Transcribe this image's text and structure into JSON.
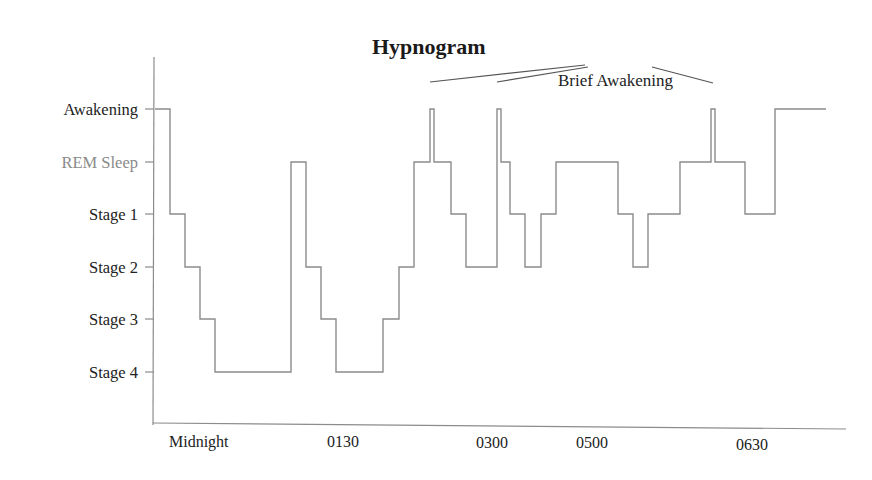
{
  "chart_data": {
    "type": "line",
    "subtype": "step",
    "title": "Hypnogram",
    "xlabel": "",
    "ylabel": "",
    "x_tick_labels": [
      "Midnight",
      "0130",
      "0300",
      "0500",
      "0630"
    ],
    "y_categories": [
      "Awakening",
      "REM Sleep",
      "Stage 1",
      "Stage 2",
      "Stage 3",
      "Stage 4"
    ],
    "annotations": [
      {
        "text": "Brief Awakening",
        "targets": [
          "awakening at ~0230",
          "awakening at ~0300",
          "awakening at ~0600"
        ]
      }
    ],
    "grid": false,
    "legend": null,
    "series": [
      {
        "name": "Sleep stage",
        "steps": [
          {
            "stage": "Awakening",
            "x_start": 155,
            "x_end": 170
          },
          {
            "stage": "Stage 1",
            "x_start": 170,
            "x_end": 185
          },
          {
            "stage": "Stage 2",
            "x_start": 185,
            "x_end": 200
          },
          {
            "stage": "Stage 3",
            "x_start": 200,
            "x_end": 215
          },
          {
            "stage": "Stage 4",
            "x_start": 215,
            "x_end": 291
          },
          {
            "stage": "REM Sleep",
            "x_start": 291,
            "x_end": 306
          },
          {
            "stage": "Stage 2",
            "x_start": 306,
            "x_end": 321
          },
          {
            "stage": "Stage 3",
            "x_start": 321,
            "x_end": 336
          },
          {
            "stage": "Stage 4",
            "x_start": 336,
            "x_end": 383
          },
          {
            "stage": "Stage 3",
            "x_start": 383,
            "x_end": 399
          },
          {
            "stage": "Stage 2",
            "x_start": 399,
            "x_end": 414
          },
          {
            "stage": "REM Sleep",
            "x_start": 414,
            "x_end": 430
          },
          {
            "stage": "Awakening",
            "x_start": 430,
            "x_end": 434
          },
          {
            "stage": "REM Sleep",
            "x_start": 434,
            "x_end": 451
          },
          {
            "stage": "Stage 1",
            "x_start": 451,
            "x_end": 466
          },
          {
            "stage": "Stage 2",
            "x_start": 466,
            "x_end": 497
          },
          {
            "stage": "Awakening",
            "x_start": 497,
            "x_end": 501
          },
          {
            "stage": "REM Sleep",
            "x_start": 501,
            "x_end": 510
          },
          {
            "stage": "Stage 1",
            "x_start": 510,
            "x_end": 525
          },
          {
            "stage": "Stage 2",
            "x_start": 525,
            "x_end": 541
          },
          {
            "stage": "Stage 1",
            "x_start": 541,
            "x_end": 556
          },
          {
            "stage": "REM Sleep",
            "x_start": 556,
            "x_end": 618
          },
          {
            "stage": "Stage 1",
            "x_start": 618,
            "x_end": 633
          },
          {
            "stage": "Stage 2",
            "x_start": 633,
            "x_end": 648
          },
          {
            "stage": "Stage 1",
            "x_start": 648,
            "x_end": 680
          },
          {
            "stage": "REM Sleep",
            "x_start": 680,
            "x_end": 711
          },
          {
            "stage": "Awakening",
            "x_start": 711,
            "x_end": 715
          },
          {
            "stage": "REM Sleep",
            "x_start": 715,
            "x_end": 745
          },
          {
            "stage": "Stage 1",
            "x_start": 745,
            "x_end": 775
          },
          {
            "stage": "Awakening",
            "x_start": 775,
            "x_end": 826
          }
        ]
      }
    ]
  },
  "colors": {
    "trace": "#8c8c8c",
    "axis": "#8c8c8c",
    "text": "#222222",
    "rem_label": "#8a8a8a"
  }
}
